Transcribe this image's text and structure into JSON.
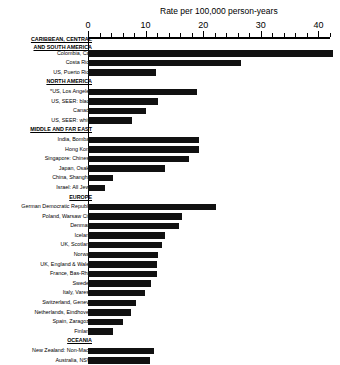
{
  "chart_data": {
    "type": "bar",
    "orientation": "horizontal",
    "title": "Rate per 100,000 person-years",
    "xlabel": "Rate per 100,000 person-years",
    "ylabel": "",
    "xlim": [
      0,
      42
    ],
    "xticks": [
      0,
      10,
      20,
      30,
      40
    ],
    "xtick_labels": [
      "0",
      "10",
      "20",
      "30",
      "40"
    ],
    "minor_tick_step": 2,
    "grid": false,
    "legend": null,
    "bar_color": "#111111",
    "categories": [
      "CARIBBEAN, CENTRAL AND SOUTH AMERICA",
      "Colombia, Cali",
      "Costa Rica",
      "US, Puerto Rico",
      "NORTH AMERICA",
      "*US, Los Angeles",
      "US, SEER: black",
      "Canada",
      "US, SEER: white",
      "MIDDLE AND FAR EAST",
      "India, Bombay",
      "Hong Kong",
      "Singapore: Chinese",
      "Japan, Osaka",
      "China, Shanghai",
      "Israel: All Jews",
      "EUROPE",
      "German Democratic Republic",
      "Poland, Warsaw City",
      "Denmark",
      "Iceland",
      "UK, Scotland",
      "Norway",
      "UK, England & Wales",
      "France, Bas-Rhin",
      "Sweden",
      "Italy, Varese",
      "Switzerland, Geneva",
      "Netherlands, Eindhoven",
      "Spain, Zaragoza",
      "Finland",
      "OCEANIA",
      "New Zealand: Non-Maori",
      "Australia, NSW"
    ],
    "values": [
      null,
      42.5,
      26.5,
      11.8,
      null,
      19.0,
      12.2,
      10.1,
      7.7,
      null,
      19.2,
      19.2,
      17.6,
      13.3,
      4.4,
      3.0,
      null,
      22.2,
      16.4,
      15.8,
      13.3,
      12.8,
      12.2,
      11.9,
      11.9,
      11.0,
      9.9,
      8.3,
      7.5,
      6.0,
      4.4,
      null,
      11.4,
      10.7
    ],
    "group_headers": [
      "CARIBBEAN, CENTRAL AND SOUTH AMERICA",
      "NORTH AMERICA",
      "MIDDLE AND FAR EAST",
      "EUROPE",
      "OCEANIA"
    ],
    "footnote_marker": "*"
  }
}
